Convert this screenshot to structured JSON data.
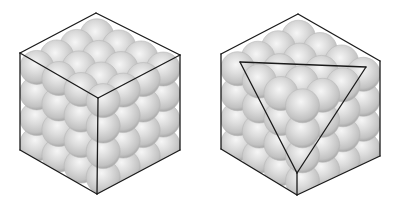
{
  "colors": {
    "background": "#ffffff",
    "edge": "#1a1a1a",
    "sphere_light": "#f4f4f4",
    "sphere_mid": "#d2d2d2",
    "sphere_dark": "#a9a9a9"
  },
  "figures": [
    {
      "name": "cube-close-packed-spheres",
      "offset_x": 0,
      "sphere_radius": 17,
      "outline": {
        "top": [
          96,
          13
        ],
        "left_upper": [
          20,
          53
        ],
        "right_upper": [
          180,
          55
        ],
        "center": [
          98,
          98
        ],
        "left_lower": [
          20,
          150
        ],
        "right_lower": [
          180,
          150
        ],
        "bottom": [
          97,
          194
        ]
      },
      "extra_lines": []
    },
    {
      "name": "cube-with-close-packed-plane-triangle",
      "offset_x": 202,
      "sphere_radius": 17,
      "outline": {
        "top": [
          96,
          14
        ],
        "left_upper": [
          19,
          54
        ],
        "right_upper": [
          178,
          61
        ],
        "center": [
          95,
          173
        ],
        "left_lower": [
          19,
          149
        ],
        "right_lower": [
          178,
          156
        ],
        "bottom": [
          95,
          195
        ]
      },
      "extra_lines": [
        [
          [
            38,
            62
          ],
          [
            164,
            67
          ]
        ],
        [
          [
            164,
            67
          ],
          [
            95,
            173
          ]
        ],
        [
          [
            95,
            173
          ],
          [
            38,
            62
          ]
        ],
        [
          [
            95,
            173
          ],
          [
            95,
            195
          ]
        ]
      ]
    }
  ]
}
